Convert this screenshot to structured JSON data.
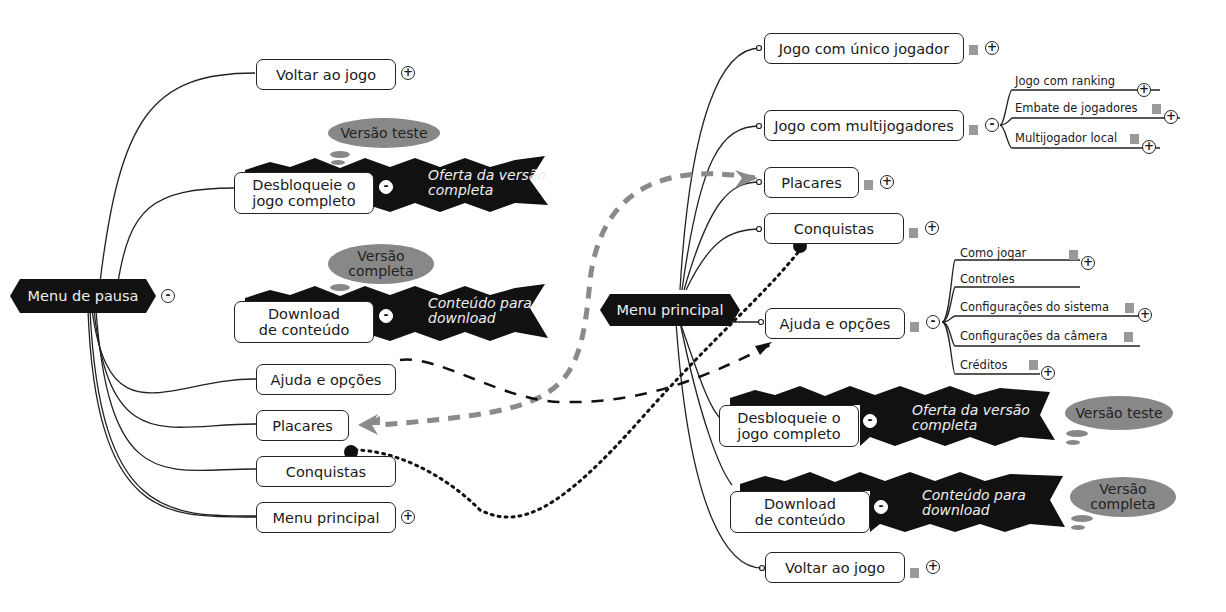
{
  "left_map": {
    "root": "Menu de pausa",
    "root_toggle": "-",
    "children": [
      {
        "label": "Voltar ao jogo",
        "toggle": "+"
      },
      {
        "label": "Desbloqueie o\njogo completo",
        "toggle": "-",
        "banner": "Oferta da versão\ncompleta",
        "cloud": "Versão teste"
      },
      {
        "label": "Download\nde conteúdo",
        "toggle": "-",
        "banner": "Conteúdo para\ndownload",
        "cloud": "Versão\ncompleta"
      },
      {
        "label": "Ajuda e opções"
      },
      {
        "label": "Placares"
      },
      {
        "label": "Conquistas"
      },
      {
        "label": "Menu principal",
        "toggle": "+"
      }
    ]
  },
  "right_map": {
    "root": "Menu principal",
    "children": [
      {
        "label": "Jogo com único jogador",
        "toggle": "+"
      },
      {
        "label": "Jogo com multijogadores",
        "toggle": "-",
        "subitems": [
          {
            "label": "Jogo com ranking",
            "toggle": "+"
          },
          {
            "label": "Embate de jogadores",
            "toggle": "+"
          },
          {
            "label": "Multijogador local",
            "toggle": "+"
          }
        ]
      },
      {
        "label": "Placares",
        "toggle": "+"
      },
      {
        "label": "Conquistas",
        "toggle": "+"
      },
      {
        "label": "Ajuda e opções",
        "toggle": "-",
        "subitems": [
          {
            "label": "Como jogar",
            "toggle": "+"
          },
          {
            "label": "Controles"
          },
          {
            "label": "Configurações do sistema",
            "toggle": "+"
          },
          {
            "label": "Configurações da câmera"
          },
          {
            "label": "Créditos",
            "toggle": "+"
          }
        ]
      },
      {
        "label": "Desbloqueie o\njogo completo",
        "toggle": "-",
        "banner": "Oferta da versão\ncompleta",
        "cloud": "Versão teste"
      },
      {
        "label": "Download\nde conteúdo",
        "toggle": "-",
        "banner": "Conteúdo para\ndownload",
        "cloud": "Versão\ncompleta"
      },
      {
        "label": "Voltar ao jogo",
        "toggle": "+"
      }
    ]
  },
  "colors": {
    "root_fill": "#111111",
    "cloud_fill": "#888888",
    "dashed_gray": "#8a8a8a",
    "line": "#222222"
  }
}
